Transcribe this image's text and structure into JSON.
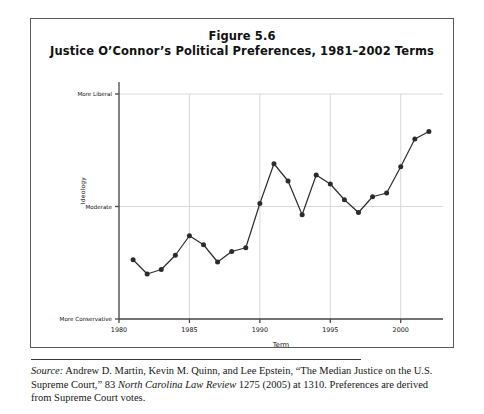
{
  "figure": {
    "title_line1": "Figure 5.6",
    "title_line2": "Justice O’Connor’s Political Preferences, 1981–2002 Terms"
  },
  "source": {
    "label": "Source:",
    "text_part1": " Andrew D. Martin, Kevin M. Quinn, and Lee Epstein, “The Median Justice on the U.S. Supreme Court,” 83 ",
    "journal": "North Carolina Law Review",
    "text_part2": " 1275 (2005) at 1310. Preferences are derived from Supreme Court votes."
  },
  "chart_data": {
    "type": "line",
    "title": "Justice O’Connor’s Political Preferences, 1981–2002 Terms",
    "xlabel": "Term",
    "ylabel": "Ideology",
    "xlim": [
      1980,
      2003
    ],
    "ylim": [
      0,
      3
    ],
    "grid": true,
    "legend": "none",
    "xticks": [
      1980,
      1985,
      1990,
      1995,
      2000
    ],
    "xticklabels": [
      "1980",
      "1985",
      "1990",
      "1995",
      "2000"
    ],
    "yticks": [
      0,
      1.5,
      3
    ],
    "yticklabels": [
      "More Conservative",
      "Moderate",
      "More Liberal"
    ],
    "marker": "filled-circle",
    "line_color": "#2b2b2b",
    "marker_color": "#2b2b2b",
    "grid_color": "#d8d8d8",
    "axis_color": "#4a4a4a",
    "series": [
      {
        "name": "O’Connor ideology",
        "x": [
          1981,
          1982,
          1983,
          1984,
          1985,
          1986,
          1987,
          1988,
          1989,
          1990,
          1991,
          1992,
          1993,
          1994,
          1995,
          1996,
          1997,
          1998,
          1999,
          2000,
          2001,
          2002
        ],
        "values": [
          0.79,
          0.6,
          0.66,
          0.85,
          1.11,
          0.99,
          0.76,
          0.9,
          0.95,
          1.54,
          2.07,
          1.84,
          1.39,
          1.92,
          1.8,
          1.59,
          1.42,
          1.63,
          1.68,
          2.03,
          2.4,
          2.5
        ]
      }
    ]
  }
}
